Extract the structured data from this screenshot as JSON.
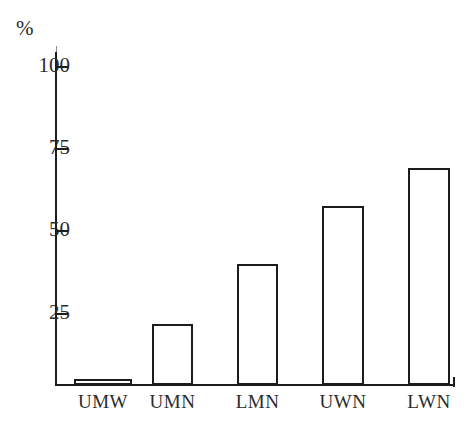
{
  "chart_data": {
    "type": "bar",
    "title": "",
    "subtitle": "",
    "xlabel": "",
    "ylabel": "%",
    "unit_symbol": "%",
    "categories": [
      "UMW",
      "UMN",
      "LMN",
      "UWN",
      "LWN"
    ],
    "values": [
      2,
      19,
      38,
      56,
      68
    ],
    "ylim": [
      0,
      100
    ],
    "y_ticks": [
      25,
      50,
      75,
      100
    ],
    "y_tick_labels": [
      "25",
      "50",
      "75",
      "100"
    ],
    "grid": false,
    "legend": null,
    "bar_style": {
      "fill": "#ffffff",
      "outline": "#1c1c1c"
    },
    "axis_color": "#1c1c1c",
    "background": "#ffffff"
  },
  "geometry": {
    "baseline_y": 385,
    "top_value_y": 66,
    "pixels_per_percent": 3.19,
    "bars": [
      {
        "label": "UMW",
        "value": 2,
        "left": 74,
        "width": 58
      },
      {
        "label": "UMN",
        "value": 19,
        "left": 152,
        "width": 41
      },
      {
        "label": "LMN",
        "value": 38,
        "left": 237,
        "width": 41
      },
      {
        "label": "UWN",
        "value": 56,
        "left": 322,
        "width": 42
      },
      {
        "label": "LWN",
        "value": 68,
        "left": 408,
        "width": 42
      }
    ],
    "y_ticks_px": [
      {
        "label": "100",
        "y": 66
      },
      {
        "label": "75",
        "y": 148
      },
      {
        "label": "50",
        "y": 230
      },
      {
        "label": "25",
        "y": 313
      }
    ]
  }
}
